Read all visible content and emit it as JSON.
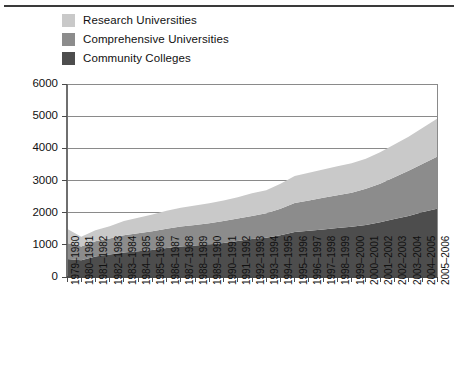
{
  "chart_data": {
    "type": "area",
    "stacked": true,
    "title": "",
    "subtitle": "",
    "xlabel": "",
    "ylabel": "",
    "ylim": [
      0,
      6000
    ],
    "ytick_step": 1000,
    "yticks": [
      "0",
      "1000",
      "2000",
      "3000",
      "4000",
      "5000",
      "6000"
    ],
    "grid": true,
    "grid_axis": "y",
    "legend_position": "above-plot-left",
    "categories": [
      "1979–1980",
      "1980–1981",
      "1981–1982",
      "1982–1983",
      "1983–1984",
      "1984–1985",
      "1985–1986",
      "1986–1987",
      "1987–1988",
      "1988–1989",
      "1989–1990",
      "1990–1991",
      "1991–1992",
      "1992–1993",
      "1993–1994",
      "1994–1995",
      "1995–1996",
      "1996–1997",
      "1997–1998",
      "1998–1999",
      "1999–2000",
      "2000–2001",
      "2001–2002",
      "2002–2003",
      "2003–2004",
      "2004–2005",
      "2005–2006"
    ],
    "series": [
      {
        "name": "Community Colleges",
        "color": "#4d4d4d",
        "values": [
          560,
          520,
          640,
          700,
          760,
          800,
          840,
          900,
          950,
          980,
          1010,
          1060,
          1120,
          1180,
          1220,
          1300,
          1400,
          1440,
          1480,
          1520,
          1560,
          1620,
          1700,
          1800,
          1900,
          2020,
          2120
        ]
      },
      {
        "name": "Comprehensive Universities",
        "color": "#8c8c8c",
        "values": [
          500,
          430,
          470,
          500,
          540,
          560,
          580,
          600,
          620,
          640,
          660,
          680,
          700,
          720,
          760,
          820,
          900,
          940,
          980,
          1020,
          1060,
          1120,
          1200,
          1300,
          1400,
          1500,
          1620
        ]
      },
      {
        "name": "Research Universities",
        "color": "#c9c9c9",
        "values": [
          440,
          300,
          340,
          380,
          440,
          480,
          520,
          560,
          580,
          600,
          620,
          640,
          660,
          700,
          720,
          780,
          840,
          860,
          880,
          900,
          920,
          940,
          980,
          1020,
          1060,
          1120,
          1180
        ]
      }
    ],
    "totals": [
      1500,
      1250,
      1450,
      1580,
      1740,
      1840,
      1940,
      2060,
      2150,
      2220,
      2290,
      2380,
      2480,
      2600,
      2700,
      2900,
      3140,
      3240,
      3340,
      3440,
      3540,
      3680,
      3880,
      4120,
      4360,
      4640,
      4920
    ]
  },
  "legend": {
    "items": [
      {
        "label": "Research Universities",
        "color": "#c9c9c9"
      },
      {
        "label": "Comprehensive Universities",
        "color": "#8c8c8c"
      },
      {
        "label": "Community Colleges",
        "color": "#4d4d4d"
      }
    ]
  },
  "caption": {
    "text": ""
  }
}
